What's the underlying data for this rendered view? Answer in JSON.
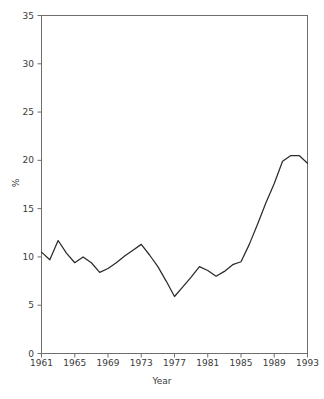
{
  "chart_data": {
    "type": "line",
    "title": "",
    "xlabel": "Year",
    "ylabel": "%",
    "xlim": [
      1961,
      1993
    ],
    "ylim": [
      0,
      35
    ],
    "grid": false,
    "legend": null,
    "xticks": [
      1961,
      1965,
      1969,
      1973,
      1977,
      1981,
      1985,
      1989,
      1993
    ],
    "xtick_labels": [
      "1961",
      "1965",
      "1969",
      "1973",
      "1977",
      "1981",
      "1985",
      "1989",
      "1993"
    ],
    "yticks": [
      0,
      5,
      10,
      15,
      20,
      25,
      30,
      35
    ],
    "ytick_labels": [
      "0",
      "5",
      "10",
      "15",
      "20",
      "25",
      "30",
      "35"
    ],
    "x": [
      1961,
      1962,
      1963,
      1964,
      1965,
      1966,
      1967,
      1968,
      1969,
      1970,
      1971,
      1972,
      1973,
      1974,
      1975,
      1976,
      1977,
      1978,
      1979,
      1980,
      1981,
      1982,
      1983,
      1984,
      1985,
      1986,
      1987,
      1988,
      1989,
      1990,
      1991,
      1992,
      1993
    ],
    "values": [
      10.5,
      9.7,
      11.7,
      10.4,
      9.4,
      10.0,
      9.4,
      8.4,
      8.8,
      9.4,
      10.1,
      10.7,
      11.3,
      10.2,
      9.0,
      7.5,
      5.9,
      6.9,
      7.9,
      9.0,
      8.6,
      8.0,
      8.5,
      9.2,
      9.5,
      11.3,
      13.4,
      15.6,
      17.6,
      19.9,
      20.5,
      20.5,
      19.7
    ],
    "series": [
      {
        "name": "percentage",
        "color": "#2b2b2b",
        "values": [
          10.5,
          9.7,
          11.7,
          10.4,
          9.4,
          10.0,
          9.4,
          8.4,
          8.8,
          9.4,
          10.1,
          10.7,
          11.3,
          10.2,
          9.0,
          7.5,
          5.9,
          6.9,
          7.9,
          9.0,
          8.6,
          8.0,
          8.5,
          9.2,
          9.5,
          11.3,
          13.4,
          15.6,
          17.6,
          19.9,
          20.5,
          20.5,
          19.7
        ]
      }
    ],
    "annotations": [],
    "colors": {
      "line": "#2b2b2b",
      "axis": "#6e6e6e",
      "text": "#3a3a3a",
      "background": "#ffffff"
    }
  }
}
